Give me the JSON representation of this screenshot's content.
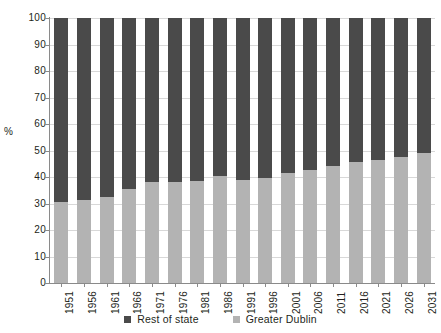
{
  "chart_data": {
    "type": "bar",
    "subtype": "stacked-100-percent",
    "title": "",
    "xlabel": "",
    "ylabel": "%",
    "ylim": [
      0,
      100
    ],
    "yticks": [
      0,
      10,
      20,
      30,
      40,
      50,
      60,
      70,
      80,
      90,
      100
    ],
    "grid": true,
    "legend_position": "bottom",
    "categories": [
      "1951",
      "1956",
      "1961",
      "1966",
      "1971",
      "1976",
      "1981",
      "1986",
      "1991",
      "1996",
      "2001",
      "2006",
      "2011",
      "2016",
      "2021",
      "2026",
      "2031"
    ],
    "series": [
      {
        "name": "Rest of state",
        "color": "#4a4a4a",
        "values": [
          69.5,
          68.5,
          67.5,
          64.5,
          62.0,
          62.0,
          61.5,
          59.5,
          61.0,
          60.5,
          58.5,
          57.5,
          56.0,
          54.5,
          53.5,
          52.5,
          51.0
        ]
      },
      {
        "name": "Greater Dublin",
        "color": "#b3b3b3",
        "values": [
          30.5,
          31.5,
          32.5,
          35.5,
          38.0,
          38.0,
          38.5,
          40.5,
          39.0,
          39.5,
          41.5,
          42.5,
          44.0,
          45.5,
          46.5,
          47.5,
          49.0
        ]
      }
    ]
  },
  "legend": {
    "items": [
      {
        "label": "Rest of state",
        "color": "#4a4a4a"
      },
      {
        "label": "Greater Dublin",
        "color": "#b3b3b3"
      }
    ]
  },
  "axis": {
    "y_title": "%"
  }
}
